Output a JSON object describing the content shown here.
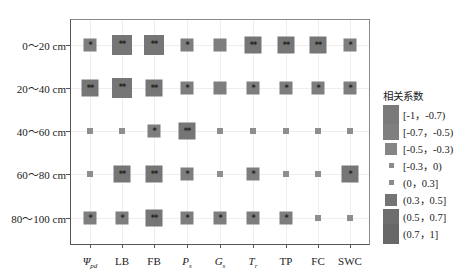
{
  "chart_data": {
    "type": "heatmap",
    "subtype": "sized-square correlation matrix",
    "title": "",
    "rows": [
      "0～20 cm",
      "20～40 cm",
      "40～60 cm",
      "60～80 cm",
      "80～100 cm"
    ],
    "columns": [
      "Ψpd",
      "LB",
      "FB",
      "Ps",
      "Gs",
      "Tr",
      "TP",
      "FC",
      "SWC"
    ],
    "columns_display": [
      {
        "main": "Ψ",
        "sub": "pd",
        "italic": true
      },
      {
        "main": "LB",
        "sub": "",
        "italic": false
      },
      {
        "main": "FB",
        "sub": "",
        "italic": false
      },
      {
        "main": "P",
        "sub": "s",
        "italic": true
      },
      {
        "main": "G",
        "sub": "s",
        "italic": true
      },
      {
        "main": "T",
        "sub": "r",
        "italic": true
      },
      {
        "main": "TP",
        "sub": "",
        "italic": false
      },
      {
        "main": "FC",
        "sub": "",
        "italic": false
      },
      {
        "main": "SWC",
        "sub": "",
        "italic": false
      }
    ],
    "legend_title": "相关系数",
    "legend": [
      {
        "label": "[-1，-0.7)",
        "size": 20,
        "color": "#7a7a7a"
      },
      {
        "label": "[-0.7，-0.5)",
        "size": 16,
        "color": "#7f7f7f"
      },
      {
        "label": "[-0.5，-0.3)",
        "size": 12,
        "color": "#858585"
      },
      {
        "label": "[-0.3，0)",
        "size": 5,
        "color": "#8c8c8c"
      },
      {
        "label": "(0，0.3]",
        "size": 5,
        "color": "#8c8c8c"
      },
      {
        "label": "(0.3，0.5]",
        "size": 12,
        "color": "#747474"
      },
      {
        "label": "(0.5，0.7]",
        "size": 16,
        "color": "#6e6e6e"
      },
      {
        "label": "(0.7，1]",
        "size": 20,
        "color": "#686868"
      }
    ],
    "cells": [
      [
        {
          "size": 13,
          "sig": "*"
        },
        {
          "size": 20,
          "sig": "**"
        },
        {
          "size": 20,
          "sig": "**"
        },
        {
          "size": 13,
          "sig": "*"
        },
        {
          "size": 13,
          "sig": ""
        },
        {
          "size": 17,
          "sig": "**"
        },
        {
          "size": 17,
          "sig": "**"
        },
        {
          "size": 17,
          "sig": "**"
        },
        {
          "size": 13,
          "sig": "*"
        }
      ],
      [
        {
          "size": 17,
          "sig": "**"
        },
        {
          "size": 20,
          "sig": "**"
        },
        {
          "size": 17,
          "sig": "**"
        },
        {
          "size": 13,
          "sig": "*"
        },
        {
          "size": 13,
          "sig": ""
        },
        {
          "size": 13,
          "sig": "*"
        },
        {
          "size": 13,
          "sig": "*"
        },
        {
          "size": 13,
          "sig": "*"
        },
        {
          "size": 13,
          "sig": "*"
        }
      ],
      [
        {
          "size": 6,
          "sig": ""
        },
        {
          "size": 6,
          "sig": ""
        },
        {
          "size": 13,
          "sig": "*"
        },
        {
          "size": 17,
          "sig": "**"
        },
        {
          "size": 6,
          "sig": ""
        },
        {
          "size": 6,
          "sig": ""
        },
        {
          "size": 6,
          "sig": ""
        },
        {
          "size": 6,
          "sig": ""
        },
        {
          "size": 6,
          "sig": ""
        }
      ],
      [
        {
          "size": 6,
          "sig": ""
        },
        {
          "size": 17,
          "sig": "**"
        },
        {
          "size": 17,
          "sig": "**"
        },
        {
          "size": 13,
          "sig": "*"
        },
        {
          "size": 6,
          "sig": ""
        },
        {
          "size": 13,
          "sig": "*"
        },
        {
          "size": 6,
          "sig": ""
        },
        {
          "size": 6,
          "sig": ""
        },
        {
          "size": 17,
          "sig": "*"
        }
      ],
      [
        {
          "size": 13,
          "sig": "*"
        },
        {
          "size": 13,
          "sig": "*"
        },
        {
          "size": 17,
          "sig": "**"
        },
        {
          "size": 13,
          "sig": "*"
        },
        {
          "size": 13,
          "sig": "*"
        },
        {
          "size": 13,
          "sig": "*"
        },
        {
          "size": 13,
          "sig": "*"
        },
        {
          "size": 6,
          "sig": ""
        },
        {
          "size": 6,
          "sig": ""
        }
      ]
    ],
    "cell_color": "#7b7b7b",
    "grid": true,
    "legend_position": "right"
  }
}
